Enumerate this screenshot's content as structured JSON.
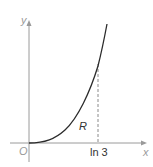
{
  "figure": {
    "axis_color": "#9a9a9a",
    "curve_color": "#2b2b2b",
    "dash_color": "#8a8a8a",
    "label_color": "#9a9a9a",
    "text_color": "#333333",
    "labels": {
      "y_axis": "y",
      "x_axis": "x",
      "origin": "O",
      "region": "R",
      "x_tick": "ln 3"
    }
  }
}
